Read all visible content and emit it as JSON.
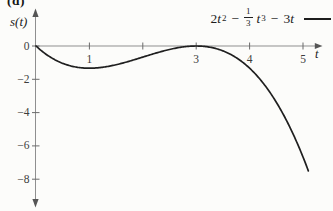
{
  "figure_label": "(d)",
  "y_axis_title": "s(t)",
  "x_axis_title": "t",
  "formula": {
    "coef1": "2",
    "var1": "t",
    "exp1": "2",
    "minus1": "−",
    "frac_num": "1",
    "frac_den": "3",
    "var2": "t",
    "exp2": "3",
    "minus2": "−",
    "coef3": "3",
    "var3": "t"
  },
  "chart_data": {
    "type": "line",
    "title": "",
    "xlabel": "t",
    "ylabel": "s(t)",
    "function": "s(t) = 2t^2 - (1/3)t^3 - 3t",
    "function_coefficients": {
      "t1": -3,
      "t2": 2,
      "t3": -0.33333333
    },
    "t_domain": [
      0,
      5.1
    ],
    "xlim": [
      0,
      5.35
    ],
    "ylim": [
      -8.8,
      1.9
    ],
    "grid": false,
    "legend_position": "top-right",
    "x_ticks": [
      1,
      2,
      3,
      4,
      5
    ],
    "x_tick_labels": [
      "1",
      "",
      "3",
      "4",
      "5"
    ],
    "y_ticks": [
      0,
      -2,
      -4,
      -6,
      -8
    ],
    "y_tick_labels": [
      "0",
      "−2",
      "−4",
      "−6",
      "−8"
    ],
    "series": [
      {
        "name": "2t² − ⅓t³ − 3t",
        "x": [
          0,
          0.25,
          0.5,
          0.75,
          1,
          1.25,
          1.5,
          1.75,
          2,
          2.25,
          2.5,
          2.75,
          3,
          3.25,
          3.5,
          3.75,
          4,
          4.25,
          4.5,
          4.75,
          5,
          5.1
        ],
        "y": [
          0,
          -0.63,
          -1.042,
          -1.266,
          -1.333,
          -1.276,
          -1.125,
          -0.911,
          -0.667,
          -0.422,
          -0.208,
          -0.057,
          0,
          -0.068,
          -0.292,
          -0.703,
          -1.333,
          -2.214,
          -3.375,
          -4.849,
          -6.667,
          -7.497
        ]
      }
    ]
  }
}
